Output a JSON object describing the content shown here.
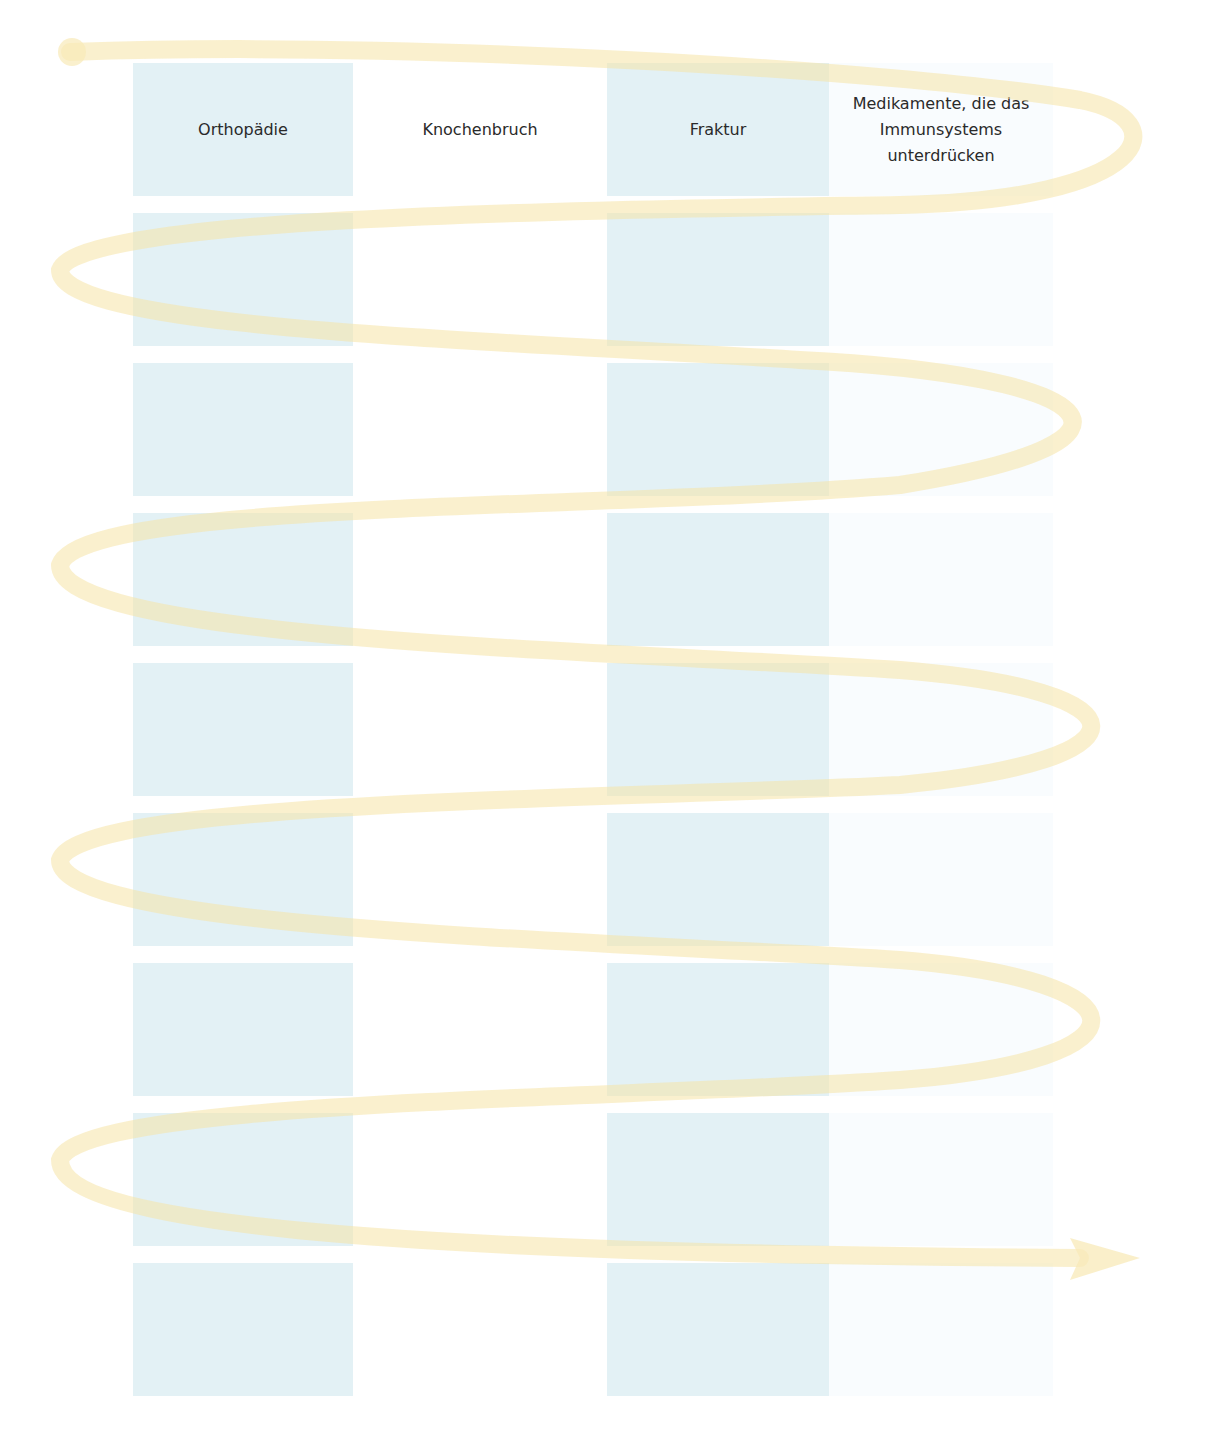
{
  "diagram": {
    "type": "word-card-grid-with-spiral-reading-path",
    "columns": 4,
    "rows": 9,
    "colors": {
      "blue_cell": "#e3f1f5",
      "white_cell": "#ffffff",
      "light_cell": "#f9fcfe",
      "spiral_line": "#fbeec4",
      "text": "#2a2a2a"
    },
    "cards": [
      [
        "Orthopädie",
        "Knochenbruch",
        "Fraktur",
        "Medikamente, die das Immunsystems unterdrücken"
      ],
      [
        "",
        "",
        "",
        ""
      ],
      [
        "",
        "",
        "",
        ""
      ],
      [
        "",
        "",
        "",
        ""
      ],
      [
        "",
        "",
        "",
        ""
      ],
      [
        "",
        "",
        "",
        ""
      ],
      [
        "",
        "",
        "",
        ""
      ],
      [
        "",
        "",
        "",
        ""
      ],
      [
        "",
        "",
        "",
        ""
      ]
    ],
    "path": {
      "start_marker": "dot-top-left",
      "end_marker": "arrow-right"
    }
  }
}
